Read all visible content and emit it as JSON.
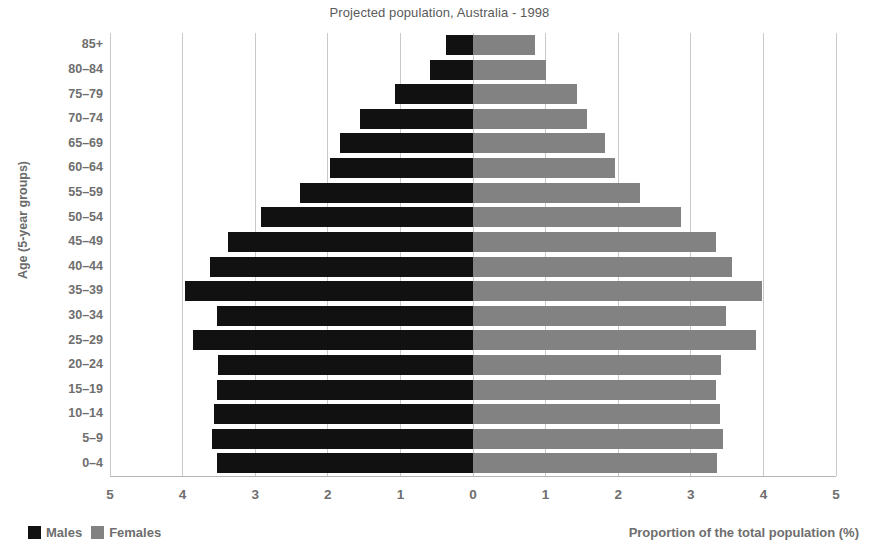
{
  "chart_data": {
    "type": "bar",
    "subtype": "population-pyramid",
    "title": "Projected population, Australia - 1998",
    "xlabel": "Proportion of the total population (%)",
    "ylabel": "Age (5-year groups)",
    "xlim": [
      -5,
      5
    ],
    "xticks": [
      "5",
      "4",
      "3",
      "2",
      "1",
      "0",
      "1",
      "2",
      "3",
      "4",
      "5"
    ],
    "xtick_values": [
      -5,
      -4,
      -3,
      -2,
      -1,
      0,
      1,
      2,
      3,
      4,
      5
    ],
    "grid": true,
    "legend_position": "bottom-left",
    "categories": [
      "85+",
      "80–84",
      "75–79",
      "70–74",
      "65–69",
      "60–64",
      "55–59",
      "50–54",
      "45–49",
      "40–44",
      "35–39",
      "30–34",
      "25–29",
      "20–24",
      "15–19",
      "10–14",
      "5–9",
      "0–4"
    ],
    "series": [
      {
        "name": "Males",
        "color": "#111111",
        "side": "left",
        "values": [
          0.37,
          0.59,
          1.07,
          1.55,
          1.83,
          1.97,
          2.38,
          2.92,
          3.38,
          3.62,
          3.97,
          3.52,
          3.85,
          3.51,
          3.52,
          3.57,
          3.6,
          3.52
        ]
      },
      {
        "name": "Females",
        "color": "#828282",
        "side": "right",
        "values": [
          0.85,
          1.0,
          1.43,
          1.57,
          1.82,
          1.96,
          2.3,
          2.86,
          3.35,
          3.57,
          3.98,
          3.48,
          3.9,
          3.41,
          3.35,
          3.4,
          3.45,
          3.36
        ]
      }
    ]
  },
  "legend": {
    "males_label": "Males",
    "females_label": "Females"
  }
}
